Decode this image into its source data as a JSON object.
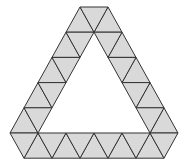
{
  "diagram": {
    "title": "",
    "colors": {
      "fill": "#d9d9d9",
      "stroke": "#333333",
      "background": "#ffffff"
    },
    "lattice": {
      "side": 28,
      "row_height": 25.2,
      "apex_x": 94,
      "apex_y": -18.2,
      "rows": 7
    },
    "outer_hexagon": [
      [
        80,
        7
      ],
      [
        108,
        7
      ],
      [
        180,
        133
      ],
      [
        166,
        158
      ],
      [
        26,
        158
      ],
      [
        12,
        133
      ]
    ],
    "inner_hole_triangle": [
      [
        94,
        32
      ],
      [
        150,
        133
      ],
      [
        38,
        133
      ]
    ],
    "counts": {
      "unit_triangles_shaded": 36
    }
  }
}
